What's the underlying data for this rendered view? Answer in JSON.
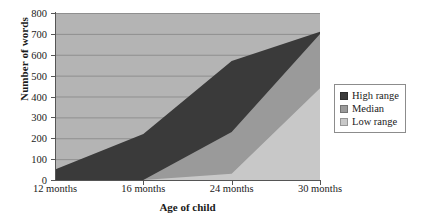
{
  "chart_data": {
    "type": "area",
    "title": "",
    "xlabel": "Age of child",
    "ylabel": "Number of words",
    "categories": [
      "12 months",
      "16 months",
      "24 months",
      "30 months"
    ],
    "x_tick_labels": [
      "12 months",
      "16 months",
      "24 months",
      "30 months"
    ],
    "y_tick_labels": [
      "0",
      "100",
      "200",
      "300",
      "400",
      "500",
      "600",
      "700",
      "800"
    ],
    "y_ticks": [
      0,
      100,
      200,
      300,
      400,
      500,
      600,
      700,
      800
    ],
    "ylim": [
      0,
      800
    ],
    "grid": true,
    "grid_axis": "y",
    "legend_position": "right",
    "series": [
      {
        "name": "High range",
        "color": "#3a3a3a",
        "values": [
          50,
          220,
          570,
          710
        ]
      },
      {
        "name": "Median",
        "color": "#9a9a9a",
        "values": [
          0,
          0,
          230,
          700
        ]
      },
      {
        "name": "Low range",
        "color": "#c8c8c8",
        "values": [
          0,
          0,
          30,
          440
        ]
      }
    ]
  },
  "legend": {
    "items": [
      {
        "label": "High range",
        "color": "#3a3a3a"
      },
      {
        "label": "Median",
        "color": "#9a9a9a"
      },
      {
        "label": "Low range",
        "color": "#c8c8c8"
      }
    ]
  },
  "colors": {
    "plot_background": "#b4b4b4",
    "high_range": "#3a3a3a",
    "median": "#9a9a9a",
    "low_range": "#c8c8c8",
    "axis": "#555555",
    "gridline": "#8f8f8f",
    "text": "#1a1a1a"
  }
}
